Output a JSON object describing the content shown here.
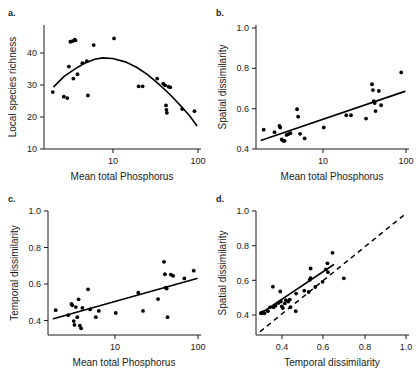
{
  "figure": {
    "background": "#ffffff",
    "point_color": "#000000",
    "line_color": "#000000"
  },
  "panels": {
    "a": {
      "letter": "a.",
      "xlabel": "Mean total Phosphorus",
      "ylabel": "Local species richness",
      "xticks": [
        "10",
        "100"
      ],
      "yticks": [
        "10",
        "20",
        "30",
        "40"
      ]
    },
    "b": {
      "letter": "b.",
      "xlabel": "Mean total Phosphorus",
      "ylabel": "Spatial dissimilarity",
      "xticks": [
        "10",
        "100"
      ],
      "yticks": [
        "0.4",
        "0.6",
        "0.8",
        "1.0"
      ]
    },
    "c": {
      "letter": "c.",
      "xlabel": "Mean total Phosphorus",
      "ylabel": "Temporal dissimilarity",
      "xticks": [
        "10",
        "100"
      ],
      "yticks": [
        "0.4",
        "0.6",
        "0.8",
        "1.0"
      ]
    },
    "d": {
      "letter": "d.",
      "xlabel": "Temporal dissimilarity",
      "ylabel": "Spatial dissimilarity",
      "xticks": [
        "0.4",
        "0.6",
        "0.8",
        "1.0"
      ],
      "yticks": [
        "0.4",
        "0.6",
        "0.8",
        "1.0"
      ]
    }
  },
  "chart_data": [
    {
      "id": "a",
      "type": "scatter",
      "title": "a.",
      "xlabel": "Mean total Phosphorus",
      "ylabel": "Local species richness",
      "xscale": "log",
      "yscale": "linear",
      "xlim": [
        3.5,
        110
      ],
      "ylim": [
        8,
        45
      ],
      "xticks": [
        10,
        100
      ],
      "yticks": [
        10,
        20,
        30,
        40
      ],
      "grid": false,
      "legend": "none",
      "points": [
        [
          3.9,
          25.0
        ],
        [
          5.0,
          23.6
        ],
        [
          5.4,
          23.2
        ],
        [
          5.6,
          32.6
        ],
        [
          5.8,
          40.0
        ],
        [
          6.1,
          40.2
        ],
        [
          6.4,
          40.6
        ],
        [
          6.5,
          40.4
        ],
        [
          6.2,
          29.0
        ],
        [
          6.8,
          30.3
        ],
        [
          7.6,
          33.6
        ],
        [
          8.4,
          34.2
        ],
        [
          8.6,
          24.0
        ],
        [
          9.8,
          39.0
        ],
        [
          15.5,
          41.0
        ],
        [
          27.0,
          26.7
        ],
        [
          29.5,
          26.7
        ],
        [
          41.0,
          29.0
        ],
        [
          47.0,
          27.5
        ],
        [
          49.0,
          27.0
        ],
        [
          50.0,
          21.0
        ],
        [
          50.5,
          19.7
        ],
        [
          51.0,
          18.8
        ],
        [
          53.0,
          26.6
        ],
        [
          55.0,
          26.4
        ],
        [
          72.0,
          19.9
        ],
        [
          95.0,
          19.3
        ]
      ],
      "fit": {
        "type": "quadratic-on-log-x",
        "description": "hump-shaped curve peaking near x=12, y=35",
        "curve_points": [
          [
            4.0,
            26.6
          ],
          [
            5.0,
            29.6
          ],
          [
            6.5,
            32.0
          ],
          [
            8.0,
            33.6
          ],
          [
            10.0,
            34.8
          ],
          [
            12.0,
            35.2
          ],
          [
            15.0,
            35.0
          ],
          [
            20.0,
            34.0
          ],
          [
            26.0,
            32.3
          ],
          [
            33.0,
            30.2
          ],
          [
            42.0,
            27.5
          ],
          [
            55.0,
            24.2
          ],
          [
            70.0,
            20.8
          ],
          [
            85.0,
            17.9
          ],
          [
            100.0,
            15.0
          ]
        ]
      }
    },
    {
      "id": "b",
      "type": "scatter",
      "title": "b.",
      "xlabel": "Mean total Phosphorus",
      "ylabel": "Spatial dissimilarity",
      "xscale": "log",
      "yscale": "linear",
      "xlim": [
        3.5,
        110
      ],
      "ylim": [
        0.36,
        1.04
      ],
      "xticks": [
        10,
        100
      ],
      "yticks": [
        0.4,
        0.6,
        0.8,
        1.0
      ],
      "grid": false,
      "legend": "none",
      "points": [
        [
          3.9,
          0.466
        ],
        [
          5.0,
          0.452
        ],
        [
          5.6,
          0.487
        ],
        [
          5.7,
          0.478
        ],
        [
          5.9,
          0.412
        ],
        [
          6.1,
          0.405
        ],
        [
          6.3,
          0.405
        ],
        [
          6.6,
          0.437
        ],
        [
          6.9,
          0.442
        ],
        [
          7.2,
          0.447
        ],
        [
          8.4,
          0.578
        ],
        [
          8.6,
          0.537
        ],
        [
          9.0,
          0.443
        ],
        [
          10.0,
          0.418
        ],
        [
          15.5,
          0.478
        ],
        [
          26.0,
          0.545
        ],
        [
          29.0,
          0.545
        ],
        [
          41.0,
          0.527
        ],
        [
          47.0,
          0.715
        ],
        [
          48.0,
          0.683
        ],
        [
          49.0,
          0.623
        ],
        [
          50.0,
          0.612
        ],
        [
          51.0,
          0.568
        ],
        [
          55.0,
          0.678
        ],
        [
          58.0,
          0.6
        ],
        [
          92.0,
          0.78
        ]
      ],
      "fit": {
        "type": "linear-on-log-x",
        "description": "positive linear trend",
        "endpoints": [
          [
            3.7,
            0.408
          ],
          [
            100.0,
            0.676
          ]
        ]
      }
    },
    {
      "id": "c",
      "type": "scatter",
      "title": "c.",
      "xlabel": "Mean total Phosphorus",
      "ylabel": "Temporal dissimilarity",
      "xscale": "log",
      "yscale": "linear",
      "xlim": [
        3.5,
        110
      ],
      "ylim": [
        0.24,
        1.04
      ],
      "xticks": [
        10,
        100
      ],
      "yticks": [
        0.4,
        0.6,
        0.8,
        1.0
      ],
      "grid": false,
      "legend": "none",
      "points": [
        [
          3.9,
          0.4
        ],
        [
          5.2,
          0.368
        ],
        [
          5.6,
          0.44
        ],
        [
          5.7,
          0.432
        ],
        [
          5.9,
          0.33
        ],
        [
          6.0,
          0.305
        ],
        [
          6.2,
          0.42
        ],
        [
          6.4,
          0.355
        ],
        [
          6.6,
          0.47
        ],
        [
          6.8,
          0.3
        ],
        [
          7.0,
          0.283
        ],
        [
          7.2,
          0.415
        ],
        [
          8.2,
          0.535
        ],
        [
          8.6,
          0.405
        ],
        [
          9.8,
          0.355
        ],
        [
          10.5,
          0.395
        ],
        [
          15.5,
          0.382
        ],
        [
          26.0,
          0.513
        ],
        [
          29.0,
          0.395
        ],
        [
          41.0,
          0.472
        ],
        [
          47.0,
          0.712
        ],
        [
          48.0,
          0.632
        ],
        [
          49.0,
          0.545
        ],
        [
          50.0,
          0.54
        ],
        [
          51.0,
          0.355
        ],
        [
          55.0,
          0.63
        ],
        [
          58.0,
          0.622
        ],
        [
          75.0,
          0.605
        ],
        [
          93.0,
          0.655
        ]
      ],
      "fit": {
        "type": "linear-on-log-x",
        "description": "positive linear trend",
        "endpoints": [
          [
            3.7,
            0.345
          ],
          [
            100.0,
            0.605
          ]
        ]
      }
    },
    {
      "id": "d",
      "type": "scatter",
      "title": "d.",
      "xlabel": "Temporal dissimilarity",
      "ylabel": "Spatial dissimilarity",
      "xscale": "linear",
      "yscale": "linear",
      "xlim": [
        0.27,
        1.04
      ],
      "ylim": [
        0.27,
        1.04
      ],
      "xticks": [
        0.4,
        0.6,
        0.8,
        1.0
      ],
      "yticks": [
        0.4,
        0.6,
        0.8,
        1.0
      ],
      "grid": false,
      "legend": "none",
      "points": [
        [
          0.295,
          0.405
        ],
        [
          0.3,
          0.408
        ],
        [
          0.305,
          0.412
        ],
        [
          0.312,
          0.405
        ],
        [
          0.33,
          0.418
        ],
        [
          0.34,
          0.442
        ],
        [
          0.355,
          0.57
        ],
        [
          0.358,
          0.443
        ],
        [
          0.368,
          0.452
        ],
        [
          0.382,
          0.468
        ],
        [
          0.392,
          0.54
        ],
        [
          0.395,
          0.478
        ],
        [
          0.4,
          0.447
        ],
        [
          0.405,
          0.437
        ],
        [
          0.415,
          0.466
        ],
        [
          0.42,
          0.487
        ],
        [
          0.432,
          0.478
        ],
        [
          0.44,
          0.49
        ],
        [
          0.443,
          0.443
        ],
        [
          0.47,
          0.418
        ],
        [
          0.472,
          0.527
        ],
        [
          0.513,
          0.545
        ],
        [
          0.535,
          0.537
        ],
        [
          0.54,
          0.612
        ],
        [
          0.545,
          0.623
        ],
        [
          0.545,
          0.683
        ],
        [
          0.568,
          0.568
        ],
        [
          0.605,
          0.6
        ],
        [
          0.622,
          0.678
        ],
        [
          0.63,
          0.715
        ],
        [
          0.632,
          0.66
        ],
        [
          0.655,
          0.78
        ],
        [
          0.712,
          0.622
        ]
      ],
      "fit": {
        "type": "linear",
        "description": "solid regression line above the 1:1 line",
        "endpoints": [
          [
            0.292,
            0.403
          ],
          [
            0.66,
            0.706
          ]
        ]
      },
      "reference_line": {
        "type": "one-to-one",
        "style": "dashed",
        "endpoints": [
          [
            0.29,
            0.29
          ],
          [
            1.02,
            1.02
          ]
        ]
      }
    }
  ]
}
